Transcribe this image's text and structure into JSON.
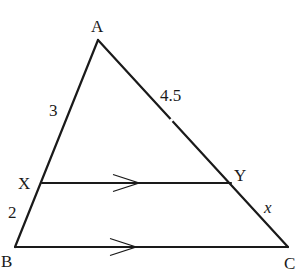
{
  "diagram": {
    "type": "triangle-with-parallel-segment",
    "stroke_color": "#1a1a1a",
    "background": "#ffffff",
    "vertices": {
      "A": {
        "label": "A",
        "x": 98,
        "y": 40
      },
      "B": {
        "label": "B",
        "x": 15,
        "y": 247
      },
      "C": {
        "label": "C",
        "x": 288,
        "y": 247
      },
      "X": {
        "label": "X",
        "x": 42,
        "y": 183
      },
      "Y": {
        "label": "Y",
        "x": 231,
        "y": 183
      }
    },
    "segments": [
      {
        "from": "A",
        "to": "B"
      },
      {
        "from": "A",
        "to": "C"
      },
      {
        "from": "B",
        "to": "C",
        "parallel_marker": true
      },
      {
        "from": "X",
        "to": "Y",
        "parallel_marker": true
      }
    ],
    "measurements": {
      "AX": "3",
      "XB": "2",
      "AY": "4.5",
      "YC": "x"
    },
    "parallel_note": "XY ∥ BC"
  }
}
